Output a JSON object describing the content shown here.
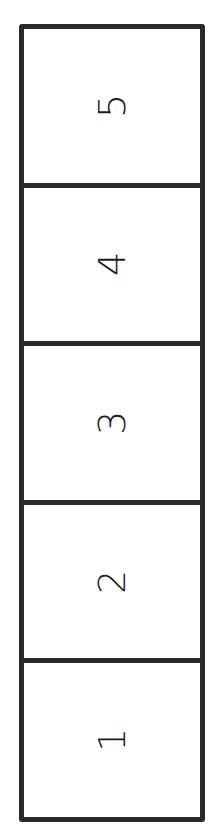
{
  "diagram": {
    "type": "vertical-stack",
    "orientation_of_labels": "rotated -90deg",
    "border_color": "#2a2a2a",
    "cells": [
      {
        "label": "5"
      },
      {
        "label": "4"
      },
      {
        "label": "3"
      },
      {
        "label": "2"
      },
      {
        "label": "1"
      }
    ]
  }
}
